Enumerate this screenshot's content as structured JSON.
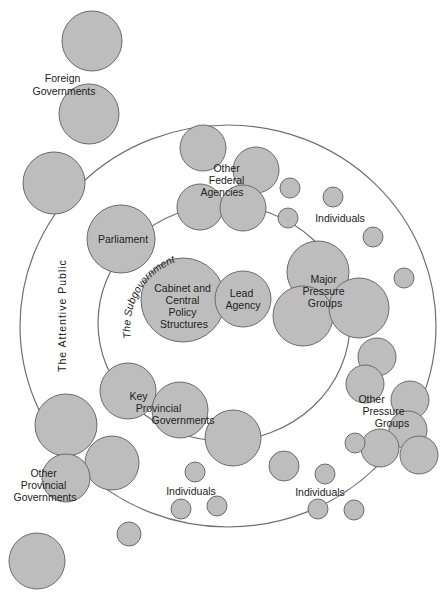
{
  "diagram": {
    "colors": {
      "node_fill": "#bdbdbd",
      "node_stroke": "#6a6a6a",
      "ring_stroke": "#6f6f6f",
      "text": "#222222",
      "background": "#ffffff"
    },
    "rings": {
      "outer": {
        "label": "The Attentive Public",
        "cx": 228,
        "cy": 326,
        "rx": 208,
        "ry": 201
      },
      "inner": {
        "label": "The Subgovernment",
        "cx": 224,
        "cy": 323,
        "rx": 126,
        "ry": 118
      }
    },
    "labels": {
      "foreign_governments": [
        "Foreign",
        "Governments"
      ],
      "other_federal_agencies": [
        "Other",
        "Federal",
        "Agencies"
      ],
      "individuals_top": "Individuals",
      "parliament": "Parliament",
      "cabinet": [
        "Cabinet and",
        "Central",
        "Policy",
        "Structures"
      ],
      "lead_agency": [
        "Lead",
        "Agency"
      ],
      "major_pressure_groups": [
        "Major",
        "Pressure",
        "Groups"
      ],
      "key_provincial_governments": [
        "Key",
        "Provincial",
        "Governments"
      ],
      "other_pressure_groups": [
        "Other",
        "Pressure",
        "Groups"
      ],
      "other_provincial_governments": [
        "Other",
        "Provincial",
        "Governments"
      ],
      "individuals_bottom_left": "Individuals",
      "individuals_bottom_right": "Individuals"
    },
    "nodes": [
      {
        "group": "foreign-governments",
        "cx": 92,
        "cy": 41,
        "r": 30
      },
      {
        "group": "foreign-governments",
        "cx": 89,
        "cy": 114,
        "r": 30
      },
      {
        "group": "attentive-public-edge",
        "cx": 54,
        "cy": 183,
        "r": 31
      },
      {
        "group": "other-federal-agencies",
        "cx": 203,
        "cy": 148,
        "r": 23
      },
      {
        "group": "other-federal-agencies",
        "cx": 256,
        "cy": 170,
        "r": 23
      },
      {
        "group": "other-federal-agencies",
        "cx": 200,
        "cy": 207,
        "r": 23
      },
      {
        "group": "other-federal-agencies",
        "cx": 243,
        "cy": 208,
        "r": 23
      },
      {
        "group": "individuals",
        "cx": 290,
        "cy": 188,
        "r": 10
      },
      {
        "group": "individuals",
        "cx": 333,
        "cy": 197,
        "r": 10
      },
      {
        "group": "individuals",
        "cx": 288,
        "cy": 218,
        "r": 10
      },
      {
        "group": "individuals",
        "cx": 373,
        "cy": 237,
        "r": 10
      },
      {
        "group": "individuals",
        "cx": 404,
        "cy": 278,
        "r": 10
      },
      {
        "group": "parliament",
        "cx": 121,
        "cy": 239,
        "r": 34
      },
      {
        "group": "cabinet",
        "cx": 183,
        "cy": 300,
        "r": 42
      },
      {
        "group": "lead-agency",
        "cx": 243,
        "cy": 299,
        "r": 28
      },
      {
        "group": "major-pressure-groups",
        "cx": 318,
        "cy": 272,
        "r": 31
      },
      {
        "group": "major-pressure-groups",
        "cx": 303,
        "cy": 316,
        "r": 30
      },
      {
        "group": "major-pressure-groups",
        "cx": 359,
        "cy": 308,
        "r": 30
      },
      {
        "group": "other-pressure-groups",
        "cx": 377,
        "cy": 357,
        "r": 19
      },
      {
        "group": "other-pressure-groups",
        "cx": 365,
        "cy": 384,
        "r": 19
      },
      {
        "group": "other-pressure-groups",
        "cx": 410,
        "cy": 400,
        "r": 19
      },
      {
        "group": "other-pressure-groups",
        "cx": 408,
        "cy": 430,
        "r": 19
      },
      {
        "group": "other-pressure-groups",
        "cx": 380,
        "cy": 448,
        "r": 19
      },
      {
        "group": "other-pressure-groups",
        "cx": 419,
        "cy": 455,
        "r": 19
      },
      {
        "group": "other-pressure-groups",
        "cx": 355,
        "cy": 443,
        "r": 10
      },
      {
        "group": "key-provincial-governments",
        "cx": 128,
        "cy": 391,
        "r": 28
      },
      {
        "group": "key-provincial-governments",
        "cx": 180,
        "cy": 410,
        "r": 28
      },
      {
        "group": "key-provincial-governments",
        "cx": 233,
        "cy": 438,
        "r": 28
      },
      {
        "group": "attentive-public-edge",
        "cx": 66,
        "cy": 425,
        "r": 31
      },
      {
        "group": "other-provincial-governments",
        "cx": 112,
        "cy": 463,
        "r": 27
      },
      {
        "group": "other-provincial-governments",
        "cx": 66,
        "cy": 478,
        "r": 24
      },
      {
        "group": "other-provincial-governments",
        "cx": 37,
        "cy": 561,
        "r": 28
      },
      {
        "group": "individuals",
        "cx": 195,
        "cy": 472,
        "r": 10
      },
      {
        "group": "individuals",
        "cx": 284,
        "cy": 466,
        "r": 15
      },
      {
        "group": "individuals",
        "cx": 325,
        "cy": 474,
        "r": 10
      },
      {
        "group": "individuals",
        "cx": 181,
        "cy": 509,
        "r": 10
      },
      {
        "group": "individuals",
        "cx": 217,
        "cy": 506,
        "r": 10
      },
      {
        "group": "individuals",
        "cx": 318,
        "cy": 509,
        "r": 10
      },
      {
        "group": "individuals",
        "cx": 354,
        "cy": 510,
        "r": 10
      },
      {
        "group": "individuals",
        "cx": 129,
        "cy": 534,
        "r": 12
      }
    ]
  }
}
